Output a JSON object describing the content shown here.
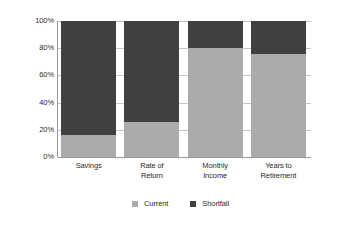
{
  "chart_data": {
    "type": "bar",
    "subtype": "stacked-bar-100-percent",
    "title": "",
    "subtitle": "",
    "xlabel": "",
    "ylabel": "",
    "categories": [
      "Savings",
      "Rate of Return",
      "Monthly Income",
      "Years to Retirement"
    ],
    "category_lines": [
      [
        "Savings"
      ],
      [
        "Rate of",
        "Return"
      ],
      [
        "Monthly",
        "Income"
      ],
      [
        "Years to",
        "Retirement"
      ]
    ],
    "series": [
      {
        "name": "Current",
        "color": "#ababab",
        "values": [
          16,
          26,
          80,
          76
        ]
      },
      {
        "name": "Shortfall",
        "color": "#404040",
        "values": [
          84,
          74,
          20,
          24
        ]
      }
    ],
    "ylim": [
      0,
      100
    ],
    "ytick_values": [
      100,
      80,
      60,
      40,
      20,
      0
    ],
    "ytick_labels": [
      "100%",
      "80%",
      "60%",
      "40%",
      "20%",
      "0%"
    ],
    "grid": true,
    "grid_axis": "y",
    "legend": true,
    "legend_position": "bottom-center",
    "legend_entries": [
      {
        "label": "Current",
        "color": "#ababab"
      },
      {
        "label": "Shortfall",
        "color": "#404040"
      }
    ],
    "background_color": "#ffffff",
    "gridline_color": "#c6c6c6",
    "axis_color": "#9a9a9a"
  }
}
